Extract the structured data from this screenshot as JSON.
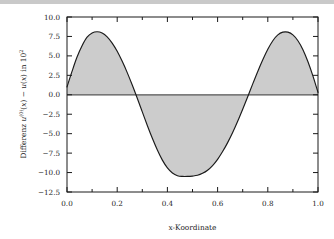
{
  "figure": {
    "background_color": "#ffffff",
    "frame_color": "#1a1a1a",
    "curve_color": "#1a1a1a",
    "fill_color": "#cccccc",
    "zero_line_color": "#555555"
  },
  "chart_data": {
    "type": "area",
    "title": "",
    "subtitle": "",
    "xlabel": "x-Koordinate",
    "ylabel": "Differenz u(0)(x) − u(x) in 10²",
    "ylabel_parts": {
      "prefix": "Differenz ",
      "symbol_1": "u",
      "superscript_1": "(0)",
      "arg_1": "(x)",
      "operator": " − ",
      "symbol_2": "u",
      "arg_2": "(x)",
      "suffix": " in 10",
      "superscript_2": "2"
    },
    "xlim": [
      0.0,
      1.0
    ],
    "ylim": [
      -12.5,
      10.0
    ],
    "xticks": [
      0.0,
      0.2,
      0.4,
      0.6,
      0.8,
      1.0
    ],
    "xtick_labels": [
      "0.0",
      "0.2",
      "0.4",
      "0.6",
      "0.8",
      "1.0"
    ],
    "yticks": [
      10.0,
      7.5,
      5.0,
      2.5,
      0.0,
      -2.5,
      -5.0,
      -7.5,
      -10.0,
      -12.5
    ],
    "ytick_labels": [
      "10.0",
      "7.5",
      "5.0",
      "2.5",
      "0.0",
      "−2.5",
      "−5.0",
      "−7.5",
      "−10.0",
      "−12.5"
    ],
    "xminor_ticks": [
      0.1,
      0.3,
      0.5,
      0.7,
      0.9
    ],
    "grid": false,
    "legend": null,
    "legend_position": "none",
    "zero_line": 0.0,
    "fill_between_zero": true,
    "annotations": [],
    "series": [
      {
        "name": "Differenz",
        "x": [
          0.0,
          0.02,
          0.04,
          0.06,
          0.08,
          0.1,
          0.12,
          0.14,
          0.16,
          0.18,
          0.2,
          0.22,
          0.24,
          0.26,
          0.28,
          0.3,
          0.32,
          0.34,
          0.36,
          0.38,
          0.4,
          0.42,
          0.44,
          0.46,
          0.48,
          0.5,
          0.52,
          0.54,
          0.56,
          0.58,
          0.6,
          0.62,
          0.64,
          0.66,
          0.68,
          0.7,
          0.72,
          0.74,
          0.76,
          0.78,
          0.8,
          0.82,
          0.84,
          0.86,
          0.88,
          0.9,
          0.92,
          0.94,
          0.96,
          0.98,
          1.0
        ],
        "y": [
          1.0,
          3.0,
          4.85,
          6.3,
          7.4,
          7.95,
          8.1,
          7.95,
          7.45,
          6.65,
          5.6,
          4.3,
          2.85,
          1.25,
          -0.45,
          -2.2,
          -3.95,
          -5.6,
          -7.1,
          -8.4,
          -9.4,
          -10.05,
          -10.4,
          -10.5,
          -10.5,
          -10.45,
          -10.35,
          -10.1,
          -9.7,
          -9.1,
          -8.3,
          -7.3,
          -6.15,
          -4.85,
          -3.4,
          -1.85,
          -0.25,
          1.4,
          3.0,
          4.5,
          5.85,
          6.95,
          7.7,
          8.05,
          8.05,
          7.7,
          6.95,
          5.8,
          4.25,
          2.4,
          0.3
        ]
      }
    ]
  }
}
